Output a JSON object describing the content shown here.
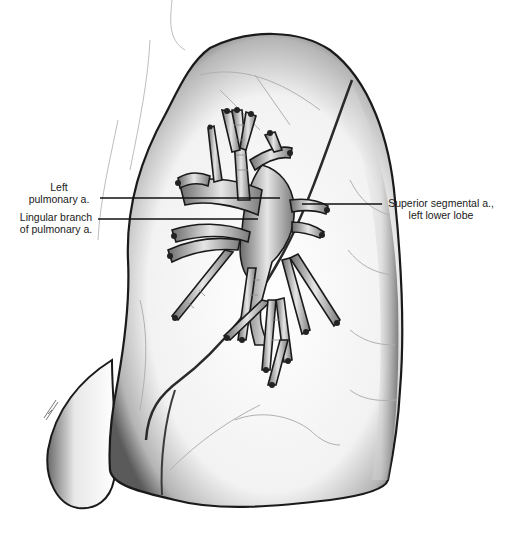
{
  "figure": {
    "colors": {
      "background": "#ffffff",
      "outline": "#1a1a1a",
      "shading": "#7a7a7a",
      "vessel_fill": "#d8d8d8",
      "leader_line": "#111111"
    },
    "labels": [
      {
        "id": "left-pulmonary-artery",
        "line1": "Left",
        "line2": "pulmonary a."
      },
      {
        "id": "lingular-branch",
        "line1": "Lingular branch",
        "line2": "of pulmonary a."
      },
      {
        "id": "superior-segmental-artery",
        "line1": "Superior segmental a.,",
        "line2": "left lower lobe"
      }
    ],
    "artist_signature": "signature (illegible)"
  }
}
